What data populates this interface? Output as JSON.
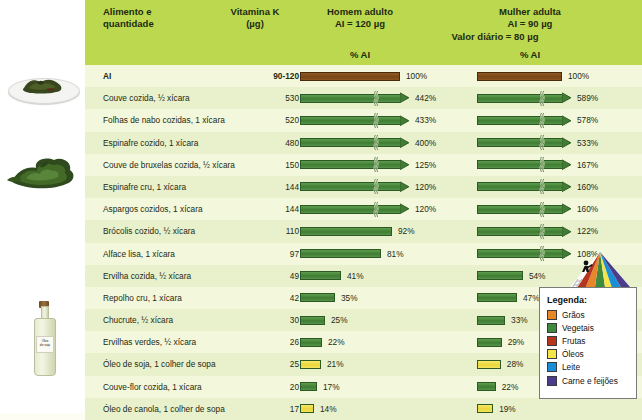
{
  "header": {
    "food_col": "Alimento e\nquantidade",
    "food_col_line1": "Alimento e",
    "food_col_line2": "quantidade",
    "vitamin_col_line1": "Vitamina K",
    "vitamin_col_line2": "(µg)",
    "man_col_line1": "Homem adulto",
    "man_col_line2": "AI = 120 µg",
    "woman_col_line1": "Mulher adulta",
    "woman_col_line2": "AI = 90 µg",
    "daily_value": "Valor diário = 80 µg",
    "pct_ai_man": "% AI",
    "pct_ai_woman": "% AI"
  },
  "photos": [
    {
      "name": "cooked-greens-on-plate",
      "alt": "Couve cozida em prato"
    },
    {
      "name": "raw-leafy-greens",
      "alt": "Folhas verdes cruas"
    },
    {
      "name": "soy-oil-bottle",
      "alt": "Óleo de soja",
      "label_line1": "Óleo",
      "label_line2": "de soja"
    }
  ],
  "legend": {
    "title": "Legenda:",
    "items": [
      {
        "label": "Grãos",
        "color": "#e8862a"
      },
      {
        "label": "Vegetais",
        "color": "#3f8a3f"
      },
      {
        "label": "Frutas",
        "color": "#b5351f"
      },
      {
        "label": "Óleos",
        "color": "#f5e44a"
      },
      {
        "label": "Leite",
        "color": "#1b8fd6"
      },
      {
        "label": "Carne e feijões",
        "color": "#4b3c8c"
      }
    ]
  },
  "chart_data": {
    "type": "bar",
    "xlabel": "% AI",
    "ylabel": "Alimento e quantidade",
    "reference_man_ai_ug": 120,
    "reference_woman_ai_ug": 90,
    "daily_value_ug": 80,
    "scale_note": "Barras acima de 100% são truncadas com marca de quebra e ponta de seta",
    "columns": [
      "Alimento e quantidade",
      "Vitamina K (µg)",
      "Homem adulto % AI",
      "Mulher adulta % AI"
    ],
    "rows": [
      {
        "food": "AI",
        "vitamin_k": "90-120",
        "man_pct": 100,
        "man_label": "100%",
        "woman_pct": 100,
        "woman_label": "100%",
        "group": "reference",
        "bold": true
      },
      {
        "food": "Couve cozida, ½ xícara",
        "vitamin_k": "530",
        "man_pct": 442,
        "man_label": "442%",
        "woman_pct": 589,
        "woman_label": "589%",
        "group": "vegetais"
      },
      {
        "food": "Folhas de nabo cozidas, 1 xícara",
        "vitamin_k": "520",
        "man_pct": 433,
        "man_label": "433%",
        "woman_pct": 578,
        "woman_label": "578%",
        "group": "vegetais"
      },
      {
        "food": "Espinafre cozido, 1 xícara",
        "vitamin_k": "480",
        "man_pct": 400,
        "man_label": "400%",
        "woman_pct": 533,
        "woman_label": "533%",
        "group": "vegetais"
      },
      {
        "food": "Couve de bruxelas cozida, ½ xícara",
        "vitamin_k": "150",
        "man_pct": 125,
        "man_label": "125%",
        "woman_pct": 167,
        "woman_label": "167%",
        "group": "vegetais"
      },
      {
        "food": "Espinafre cru, 1 xícara",
        "vitamin_k": "144",
        "man_pct": 120,
        "man_label": "120%",
        "woman_pct": 160,
        "woman_label": "160%",
        "group": "vegetais"
      },
      {
        "food": "Aspargos cozidos, 1 xícara",
        "vitamin_k": "144",
        "man_pct": 120,
        "man_label": "120%",
        "woman_pct": 160,
        "woman_label": "160%",
        "group": "vegetais"
      },
      {
        "food": "Brócolis cozido, ½ xícara",
        "vitamin_k": "110",
        "man_pct": 92,
        "man_label": "92%",
        "woman_pct": 122,
        "woman_label": "122%",
        "group": "vegetais"
      },
      {
        "food": "Alface lisa, 1 xícara",
        "vitamin_k": "97",
        "man_pct": 81,
        "man_label": "81%",
        "woman_pct": 108,
        "woman_label": "108%",
        "group": "vegetais"
      },
      {
        "food": "Ervilha cozida, ½ xícara",
        "vitamin_k": "49",
        "man_pct": 41,
        "man_label": "41%",
        "woman_pct": 54,
        "woman_label": "54%",
        "group": "vegetais"
      },
      {
        "food": "Repolho cru, 1 xícara",
        "vitamin_k": "42",
        "man_pct": 35,
        "man_label": "35%",
        "woman_pct": 47,
        "woman_label": "47%",
        "group": "vegetais"
      },
      {
        "food": "Chucrute, ½ xícara",
        "vitamin_k": "30",
        "man_pct": 25,
        "man_label": "25%",
        "woman_pct": 33,
        "woman_label": "33%",
        "group": "vegetais"
      },
      {
        "food": "Ervilhas verdes, ½ xícara",
        "vitamin_k": "26",
        "man_pct": 22,
        "man_label": "22%",
        "woman_pct": 29,
        "woman_label": "29%",
        "group": "vegetais"
      },
      {
        "food": "Óleo de soja, 1 colher de sopa",
        "vitamin_k": "25",
        "man_pct": 21,
        "man_label": "21%",
        "woman_pct": 28,
        "woman_label": "28%",
        "group": "oleos"
      },
      {
        "food": "Couve-flor cozida, 1 xícara",
        "vitamin_k": "20",
        "man_pct": 17,
        "man_label": "17%",
        "woman_pct": 22,
        "woman_label": "22%",
        "group": "vegetais"
      },
      {
        "food": "Óleo de canola, 1 colher de sopa",
        "vitamin_k": "17",
        "man_pct": 14,
        "man_label": "14%",
        "woman_pct": 19,
        "woman_label": "19%",
        "group": "oleos"
      }
    ]
  }
}
